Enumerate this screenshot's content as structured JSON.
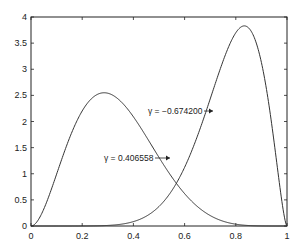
{
  "chart_data": {
    "type": "line",
    "title": "",
    "xlabel": "",
    "ylabel": "",
    "xlim": [
      0,
      1
    ],
    "ylim": [
      0,
      4
    ],
    "grid": false,
    "legend": null,
    "x_ticks": [
      "0",
      "0.2",
      "0.4",
      "0.6",
      "0.8",
      "1"
    ],
    "y_ticks": [
      "0",
      "0.5",
      "1",
      "1.5",
      "2",
      "2.5",
      "3",
      "3.5",
      "4"
    ],
    "series": [
      {
        "name": "γ = 0.406558",
        "peak": {
          "x": 0.285,
          "y": 2.55
        },
        "x": [
          0,
          0.05,
          0.1,
          0.15,
          0.2,
          0.25,
          0.3,
          0.35,
          0.4,
          0.45,
          0.5,
          0.55,
          0.6,
          0.65,
          0.7,
          0.75,
          0.8,
          0.85,
          0.9,
          0.95,
          1
        ],
        "values": [
          0,
          0.39,
          1.19,
          1.88,
          2.35,
          2.53,
          2.54,
          2.35,
          2.09,
          1.74,
          1.37,
          1.02,
          0.71,
          0.45,
          0.27,
          0.14,
          0.06,
          0.02,
          0.0,
          0.0,
          0
        ]
      },
      {
        "name": "γ = −0.674200",
        "peak": {
          "x": 0.835,
          "y": 3.83
        },
        "x": [
          0,
          0.05,
          0.1,
          0.15,
          0.2,
          0.25,
          0.3,
          0.35,
          0.4,
          0.45,
          0.5,
          0.55,
          0.6,
          0.65,
          0.7,
          0.75,
          0.8,
          0.85,
          0.9,
          0.95,
          1
        ],
        "values": [
          0,
          0,
          0,
          0,
          0,
          0,
          0.01,
          0.02,
          0.05,
          0.11,
          0.21,
          0.38,
          0.64,
          1.01,
          1.53,
          2.19,
          3.09,
          3.82,
          3.56,
          2.4,
          0
        ]
      }
    ],
    "annotations": [
      {
        "text": "γ = 0.406558",
        "points_to_series": 0,
        "at": {
          "x": 0.545,
          "y": 1.15
        }
      },
      {
        "text": "γ = −0.674200",
        "points_to_series": 1,
        "at": {
          "x": 0.718,
          "y": 2.48
        }
      }
    ]
  },
  "axes": {
    "x_ticks": [
      "0",
      "0.2",
      "0.4",
      "0.6",
      "0.8",
      "1"
    ],
    "y_ticks": [
      "0",
      "0.5",
      "1",
      "1.5",
      "2",
      "2.5",
      "3",
      "3.5",
      "4"
    ]
  },
  "annotations": {
    "a1": "γ = 0.406558",
    "a2": "γ = −0.674200"
  }
}
